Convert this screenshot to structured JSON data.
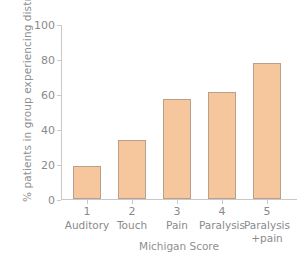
{
  "chart_data": {
    "type": "bar",
    "title": "",
    "xlabel": "Michigan Score",
    "ylabel": "% patients in group experiencing distress",
    "categories": [
      "Auditory",
      "Touch",
      "Pain",
      "Paralysis",
      "Paralysis\n+pain"
    ],
    "category_numbers": [
      "1",
      "2",
      "3",
      "4",
      "5"
    ],
    "values": [
      19,
      33.5,
      57,
      61,
      77.5
    ],
    "ylim": [
      0,
      100
    ],
    "yticks": [
      "0",
      "20",
      "40",
      "60",
      "80",
      "100"
    ],
    "ytick_values": [
      0,
      20,
      40,
      60,
      80,
      100
    ],
    "grid": false,
    "legend": "none",
    "bar_color": "#f6c79c",
    "bar_edge_color": "#b8a08c",
    "axis_color": "#c9c9c9",
    "text_color": "#8a8a8a"
  }
}
